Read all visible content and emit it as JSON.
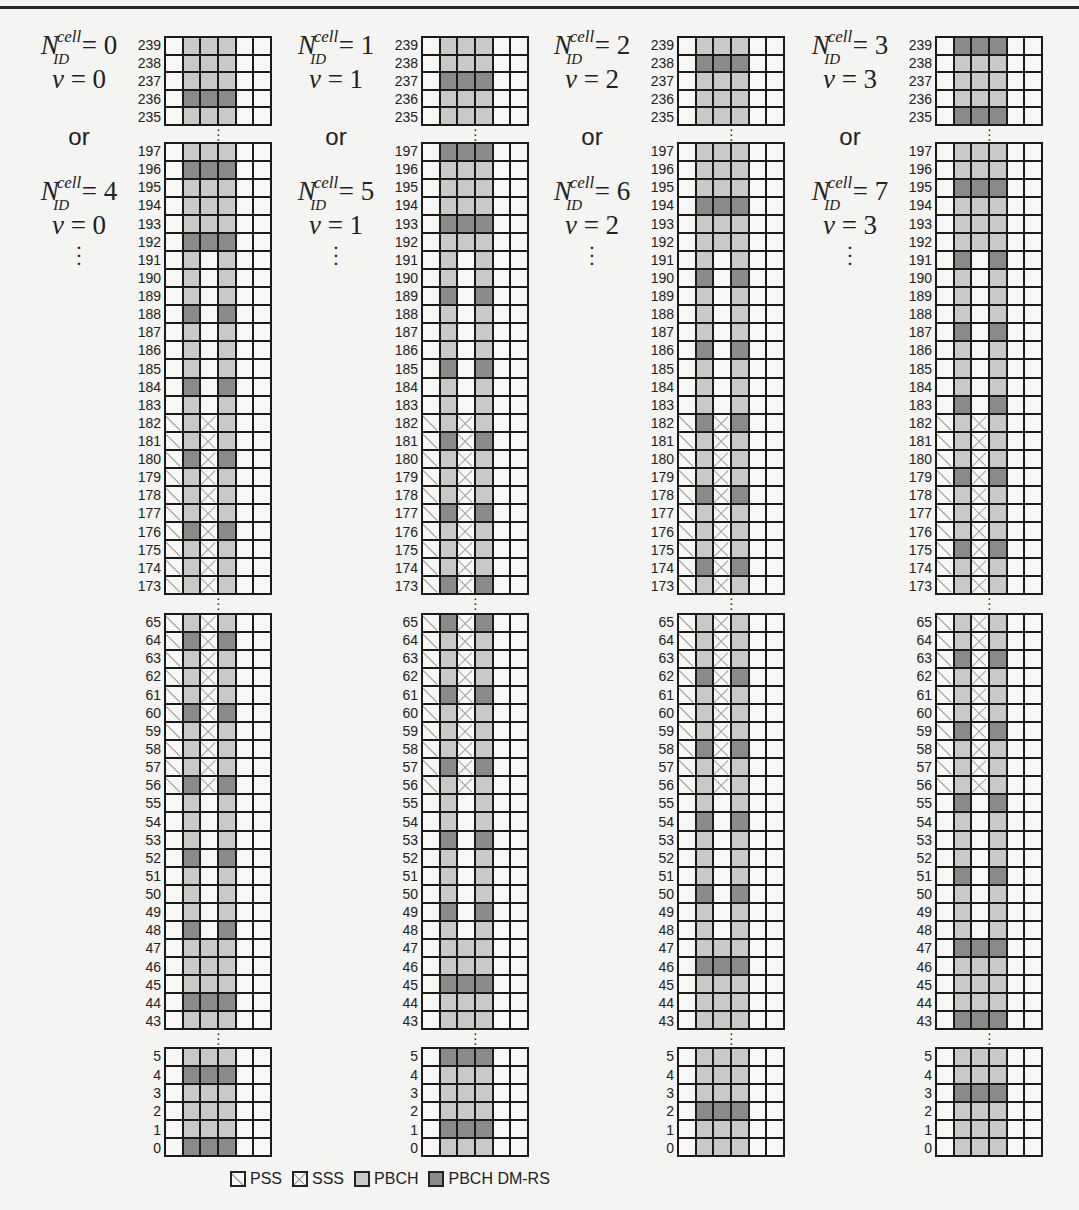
{
  "figure": {
    "type": "ssb-resource-grid",
    "grid_columns": 6,
    "column_roles": [
      "pss",
      "pbch",
      "sss_or_pbch",
      "pbch",
      "empty",
      "empty"
    ],
    "pss_range": [
      56,
      182
    ],
    "sss_range": [
      56,
      182
    ],
    "pbch_col2_low_max": 47,
    "pbch_col2_high_min": 192,
    "dmrs_rule": "k mod 4 == v",
    "blocks": [
      {
        "from": 239,
        "to": 235,
        "top": 36,
        "bottom": 126
      },
      {
        "from": 197,
        "to": 173,
        "top": 142,
        "bottom": 595
      },
      {
        "from": 65,
        "to": 43,
        "top": 613,
        "bottom": 1030
      },
      {
        "from": 5,
        "to": 0,
        "top": 1047,
        "bottom": 1157
      }
    ],
    "panels": [
      {
        "v": 0,
        "grid_left": 164,
        "label_a": {
          "nid": "0",
          "v": "0"
        },
        "or": "or",
        "label_b": {
          "nid": "4",
          "v": "0"
        }
      },
      {
        "v": 1,
        "grid_left": 421,
        "label_a": {
          "nid": "1",
          "v": "1"
        },
        "or": "or",
        "label_b": {
          "nid": "5",
          "v": "1"
        }
      },
      {
        "v": 2,
        "grid_left": 677,
        "label_a": {
          "nid": "2",
          "v": "2"
        },
        "or": "or",
        "label_b": {
          "nid": "6",
          "v": "2"
        }
      },
      {
        "v": 3,
        "grid_left": 935,
        "label_a": {
          "nid": "3",
          "v": "3"
        },
        "or": "or",
        "label_b": {
          "nid": "7",
          "v": "3"
        }
      }
    ],
    "symbols": {
      "N": "N",
      "cell": "cell",
      "ID": "ID",
      "v": "v",
      "equals": "="
    }
  },
  "legend": {
    "items": [
      {
        "key": "pss",
        "label": "PSS"
      },
      {
        "key": "sss",
        "label": "SSS"
      },
      {
        "key": "pbch",
        "label": "PBCH"
      },
      {
        "key": "dmrs",
        "label": "PBCH DM-RS"
      }
    ]
  },
  "colors": {
    "background": "#f4f4f2",
    "empty": "#f7f7f5",
    "pbch": "#c9c9c7",
    "dmrs": "#8a8a88",
    "grid_line": "#1a1a1a"
  }
}
